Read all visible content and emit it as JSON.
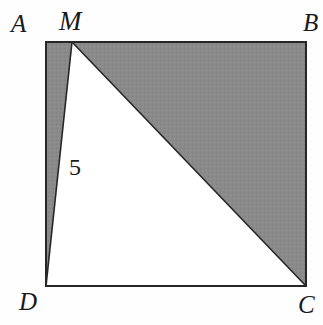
{
  "figure": {
    "background_color": "#fefefe",
    "shade_color": "#8a8a8a",
    "outline_color": "#262626",
    "labels": {
      "A": "A",
      "B": "B",
      "C": "C",
      "D": "D",
      "M": "M",
      "segment_MD_length": "5"
    },
    "geometry": {
      "square": {
        "left": 46,
        "top": 42,
        "right": 306,
        "bottom": 286,
        "corner_A": [
          46,
          42
        ],
        "corner_B": [
          306,
          42
        ],
        "corner_C": [
          306,
          286
        ],
        "corner_D": [
          46,
          286
        ]
      },
      "point_M": [
        72,
        42
      ],
      "shaded_triangle_AMD": [
        [
          46,
          42
        ],
        [
          72,
          42
        ],
        [
          46,
          286
        ]
      ],
      "shaded_triangle_MBC": [
        [
          72,
          42
        ],
        [
          306,
          42
        ],
        [
          306,
          286
        ]
      ],
      "unshaded_triangle_MDC": [
        [
          72,
          42
        ],
        [
          46,
          286
        ],
        [
          306,
          286
        ]
      ],
      "segment_MD": [
        [
          72,
          42
        ],
        [
          46,
          286
        ]
      ],
      "segment_MC": [
        [
          72,
          42
        ],
        [
          306,
          286
        ]
      ]
    }
  }
}
